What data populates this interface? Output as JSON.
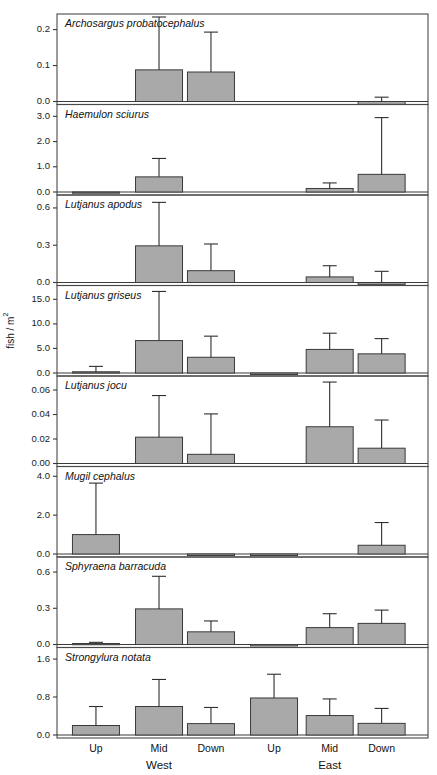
{
  "figure": {
    "y_axis_title": "fish / m",
    "y_axis_title_sup": "2",
    "x_categories": [
      "Up",
      "Mid",
      "Down",
      "Up",
      "Mid",
      "Down"
    ],
    "x_groups": [
      "West",
      "East"
    ]
  },
  "chart_data": {
    "type": "bar",
    "title": "",
    "xlabel": "",
    "ylabel": "fish / m^2",
    "grid": false,
    "legend": "none",
    "orientation": "vertical",
    "error_bars": "upper whisker only (mean + SD)",
    "categories": [
      "Up West",
      "Mid West",
      "Down West",
      "Up East",
      "Mid East",
      "Down East"
    ],
    "panels": [
      {
        "species": "Archosargus probatocephalus",
        "yticks": [
          "0.0",
          "0.1",
          "0.2"
        ],
        "ytick_values": [
          0.0,
          0.1,
          0.2
        ],
        "ylim": [
          0.0,
          0.235
        ],
        "values": [
          0.0,
          0.088,
          0.082,
          0.0,
          0.0,
          -0.008
        ],
        "errors_upper": [
          0.0,
          0.235,
          0.193,
          0.0,
          0.0,
          0.012
        ]
      },
      {
        "species": "Haemulon sciurus",
        "yticks": [
          "0.0",
          "1.0",
          "2.0",
          "3.0"
        ],
        "ytick_values": [
          0.0,
          1.0,
          2.0,
          3.0
        ],
        "ylim": [
          0.0,
          3.35
        ],
        "values": [
          -0.03,
          0.6,
          0.0,
          0.0,
          0.14,
          0.7
        ],
        "errors_upper": [
          0.0,
          1.33,
          0.0,
          0.0,
          0.36,
          2.95
        ]
      },
      {
        "species": "Lutjanus apodus",
        "yticks": [
          "0.0",
          "0.3",
          "0.6"
        ],
        "ytick_values": [
          0.0,
          0.3,
          0.6
        ],
        "ylim": [
          0.0,
          0.68
        ],
        "values": [
          0.0,
          0.295,
          0.095,
          0.0,
          0.045,
          -0.015
        ],
        "errors_upper": [
          0.0,
          0.645,
          0.31,
          0.0,
          0.135,
          0.09
        ]
      },
      {
        "species": "Lutjanus griseus",
        "yticks": [
          "0.0",
          "5.0",
          "10.0",
          "15.0"
        ],
        "ytick_values": [
          0.0,
          5.0,
          10.0,
          15.0
        ],
        "ylim": [
          0.0,
          17.2
        ],
        "values": [
          0.25,
          6.6,
          3.2,
          -0.3,
          4.8,
          3.9
        ],
        "errors_upper": [
          1.35,
          16.6,
          7.5,
          0.0,
          8.1,
          7.0
        ]
      },
      {
        "species": "Lutjanus jocu",
        "yticks": [
          "0.00",
          "0.02",
          "0.04",
          "0.06"
        ],
        "ytick_values": [
          0.0,
          0.02,
          0.04,
          0.06
        ],
        "ylim": [
          0.0,
          0.069
        ],
        "values": [
          0.0,
          0.0215,
          0.0075,
          0.0,
          0.03,
          0.0125
        ],
        "errors_upper": [
          0.0,
          0.0555,
          0.0405,
          0.0,
          0.0665,
          0.0355
        ]
      },
      {
        "species": "Mugil cephalus",
        "yticks": [
          "0.0",
          "2.0",
          "4.0"
        ],
        "ytick_values": [
          0.0,
          2.0,
          4.0
        ],
        "ylim": [
          0.0,
          4.35
        ],
        "values": [
          1.0,
          0.0,
          -0.08,
          -0.08,
          0.0,
          0.45
        ],
        "errors_upper": [
          3.65,
          0.0,
          0.0,
          0.0,
          0.0,
          1.62
        ]
      },
      {
        "species": "Sphyraena barracuda",
        "yticks": [
          "0.0",
          "0.3",
          "0.6"
        ],
        "ytick_values": [
          0.0,
          0.3,
          0.6
        ],
        "ylim": [
          0.0,
          0.7
        ],
        "values": [
          0.008,
          0.295,
          0.105,
          -0.012,
          0.14,
          0.175
        ],
        "errors_upper": [
          0.018,
          0.565,
          0.195,
          0.0,
          0.255,
          0.285
        ]
      },
      {
        "species": "Strongylura notata",
        "yticks": [
          "0.0",
          "0.8",
          "1.6"
        ],
        "ytick_values": [
          0.0,
          0.8,
          1.6
        ],
        "ylim": [
          0.0,
          1.78
        ],
        "values": [
          0.2,
          0.6,
          0.24,
          0.78,
          0.41,
          0.245
        ],
        "errors_upper": [
          0.6,
          1.17,
          0.58,
          1.28,
          0.76,
          0.56
        ]
      }
    ]
  }
}
